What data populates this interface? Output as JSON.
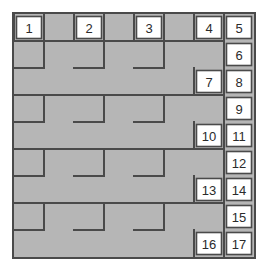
{
  "figure": {
    "grid": {
      "columns": 8,
      "rows": 9,
      "cell_width": 30,
      "cell_height": 27
    },
    "colors": {
      "tile_fill": "#b6b6b6",
      "line": "#4a4a4a",
      "white_cell_fill": "#ffffff",
      "number_text": "#2b2b2b",
      "background": "#ffffff"
    }
  },
  "numbered_cells": [
    {
      "label": "1",
      "col": 0,
      "row": 0
    },
    {
      "label": "2",
      "col": 2,
      "row": 0
    },
    {
      "label": "3",
      "col": 4,
      "row": 0
    },
    {
      "label": "4",
      "col": 6,
      "row": 0
    },
    {
      "label": "5",
      "col": 7,
      "row": 0
    },
    {
      "label": "6",
      "col": 7,
      "row": 1
    },
    {
      "label": "7",
      "col": 6,
      "row": 2
    },
    {
      "label": "8",
      "col": 7,
      "row": 2
    },
    {
      "label": "9",
      "col": 7,
      "row": 3
    },
    {
      "label": "10",
      "col": 6,
      "row": 4
    },
    {
      "label": "11",
      "col": 7,
      "row": 4
    },
    {
      "label": "12",
      "col": 7,
      "row": 5
    },
    {
      "label": "13",
      "col": 6,
      "row": 6
    },
    {
      "label": "14",
      "col": 7,
      "row": 6
    },
    {
      "label": "15",
      "col": 7,
      "row": 7
    },
    {
      "label": "16",
      "col": 6,
      "row": 8
    },
    {
      "label": "17",
      "col": 7,
      "row": 8
    }
  ],
  "tile_lines": [
    {
      "x1": 0,
      "y1": 1,
      "x2": 2,
      "y2": 1
    },
    {
      "x1": 2,
      "y1": 0,
      "x2": 2,
      "y2": 1
    },
    {
      "x1": 2,
      "y1": 1,
      "x2": 2,
      "y2": 1
    },
    {
      "x1": 0,
      "y1": 3,
      "x2": 1,
      "y2": 3
    },
    {
      "x1": 1,
      "y1": 2,
      "x2": 1,
      "y2": 3
    },
    {
      "x1": 1,
      "y1": 2,
      "x2": 2,
      "y2": 2
    },
    {
      "x1": 2,
      "y1": 2,
      "x2": 2,
      "y2": 3
    },
    {
      "x1": 2,
      "y1": 3,
      "x2": 4,
      "y2": 3
    },
    {
      "x1": 0,
      "y1": 5,
      "x2": 1,
      "y2": 5
    },
    {
      "x1": 1,
      "y1": 4,
      "x2": 1,
      "y2": 5
    },
    {
      "x1": 1,
      "y1": 4,
      "x2": 2,
      "y2": 4
    },
    {
      "x1": 2,
      "y1": 4,
      "x2": 2,
      "y2": 5
    },
    {
      "x1": 0,
      "y1": 7,
      "x2": 1,
      "y2": 7
    },
    {
      "x1": 1,
      "y1": 6,
      "x2": 1,
      "y2": 7
    },
    {
      "x1": 1,
      "y1": 6,
      "x2": 2,
      "y2": 6
    },
    {
      "x1": 2,
      "y1": 6,
      "x2": 2,
      "y2": 7
    }
  ],
  "legend": {
    "description": "Gray S-shaped tetromino tiles cover the board; white squares are numbered 1 through 17 along the top row and right edge."
  }
}
